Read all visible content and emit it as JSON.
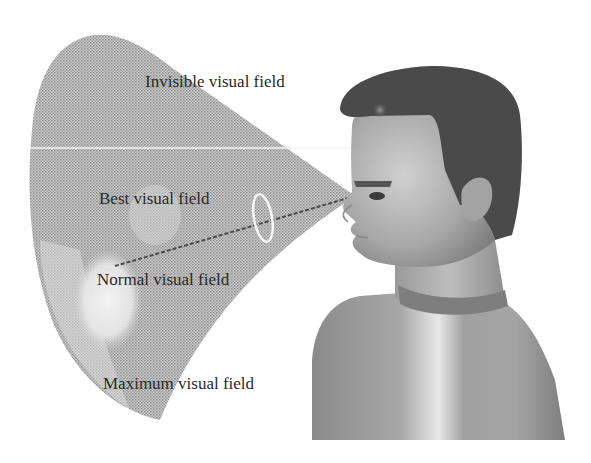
{
  "diagram": {
    "labels": {
      "invisible": "Invisible visual field",
      "best": "Best visual field",
      "normal": "Normal visual field",
      "maximum": "Maximum visual field"
    },
    "colors": {
      "background": "#ffffff",
      "cone": "#b8b8b8",
      "cone_dark": "#9a9a9a",
      "normal_zone": "#e6e6e6",
      "hair": "#4a4a4a",
      "skin": "#a9a9a9",
      "text": "#2a2a2a",
      "guide_line": "#f2f2f2"
    },
    "elements": {
      "figure": "human-head-and-shoulders-profile",
      "sight_line": "dashed line from eye into visual field",
      "focus_ring": "white ellipse marking best visual field",
      "horizon_line": "white horizontal eye-level line"
    }
  }
}
